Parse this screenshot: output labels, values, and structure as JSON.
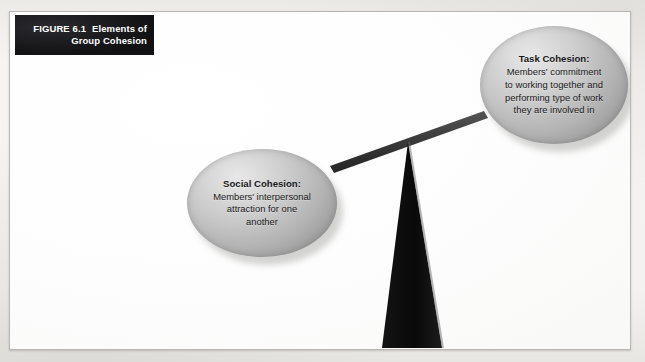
{
  "figure": {
    "label": "FIGURE 6.1",
    "title": "Elements of\nGroup Cohesion",
    "banner_color": "#16161a",
    "banner_text_color": "#ffffff",
    "frame_border_color": "#b9b7b4",
    "page_background": "#f4f3f1",
    "panel_background": "#fefefe"
  },
  "diagram": {
    "type": "balance-scale",
    "fulcrum": {
      "name": "fulcrum-triangle",
      "color": "#0e0e0e"
    },
    "beam": {
      "name": "balance-beam",
      "color": "#3b3b3b",
      "tilt": "right-side-high"
    },
    "nodes": [
      {
        "id": "task-cohesion",
        "title": "Task Cohesion:",
        "body": "Members' commitment\nto working together and\nperforming type of work\nthey are involved in",
        "shape": "ellipse",
        "fill": "#c8c8c8",
        "side": "right"
      },
      {
        "id": "social-cohesion",
        "title": "Social Cohesion:",
        "body": "Members' interpersonal\nattraction for one\nanother",
        "shape": "ellipse",
        "fill": "#c8c8c8",
        "side": "left"
      }
    ]
  }
}
